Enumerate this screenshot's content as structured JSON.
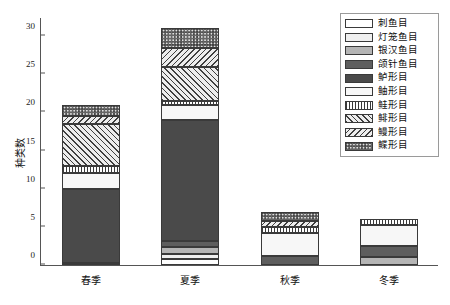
{
  "chart_data": {
    "type": "bar",
    "subtype": "stacked-bar",
    "title": "",
    "xlabel": "",
    "ylabel": "种类数",
    "categories": [
      "春季",
      "夏季",
      "秋季",
      "冬季"
    ],
    "ylim": [
      0,
      32.5
    ],
    "yticks": [
      0,
      5,
      10,
      15,
      20,
      25,
      30
    ],
    "grid": false,
    "legend_position": "top-right",
    "totals": [
      21,
      31,
      7,
      6
    ],
    "series": [
      {
        "name": "刺鱼目",
        "pattern": "solid",
        "color": "#ffffff",
        "values": [
          0.3,
          0.8,
          0,
          0
        ]
      },
      {
        "name": "灯笼鱼目",
        "pattern": "solid",
        "color": "#efefef",
        "values": [
          0,
          0.7,
          0,
          0
        ]
      },
      {
        "name": "银汉鱼目",
        "pattern": "solid",
        "color": "#b5b5b5",
        "values": [
          0,
          0.8,
          0,
          1.0
        ]
      },
      {
        "name": "颌针鱼目",
        "pattern": "solid",
        "color": "#5e5e5e",
        "values": [
          0,
          0.9,
          1.2,
          1.5
        ]
      },
      {
        "name": "鲈形目",
        "pattern": "solid",
        "color": "#4a4a4a",
        "values": [
          9.7,
          15.8,
          0,
          0
        ]
      },
      {
        "name": "鲉形目",
        "pattern": "dots",
        "color": "#f7f7f7",
        "values": [
          2.0,
          2.0,
          3.0,
          2.7
        ]
      },
      {
        "name": "鲑形目",
        "pattern": "vert",
        "color": "#ffffff",
        "values": [
          1.0,
          0.5,
          0.8,
          0.8
        ]
      },
      {
        "name": "鲱形目",
        "pattern": "diag-r",
        "color": "#ededed",
        "values": [
          5.5,
          4.5,
          0,
          0
        ]
      },
      {
        "name": "鳗形目",
        "pattern": "diag-l",
        "color": "#ededed",
        "values": [
          1.0,
          2.5,
          0.8,
          0
        ]
      },
      {
        "name": "鲽形目",
        "pattern": "check",
        "color": "#e2e2e2",
        "values": [
          1.5,
          2.5,
          1.2,
          0
        ]
      }
    ]
  },
  "legend": {
    "items": [
      {
        "label": "刺鱼目"
      },
      {
        "label": "灯笼鱼目"
      },
      {
        "label": "银汉鱼目"
      },
      {
        "label": "颌针鱼目"
      },
      {
        "label": "鲈形目"
      },
      {
        "label": "鲉形目"
      },
      {
        "label": "鲑形目"
      },
      {
        "label": "鲱形目"
      },
      {
        "label": "鳗形目"
      },
      {
        "label": "鲽形目"
      }
    ]
  },
  "axes": {
    "y_label": "种类数",
    "y_tick_labels": [
      "0",
      "5",
      "10",
      "15",
      "20",
      "25",
      "30"
    ],
    "x_tick_labels": [
      "春季",
      "夏季",
      "秋季",
      "冬季"
    ]
  }
}
